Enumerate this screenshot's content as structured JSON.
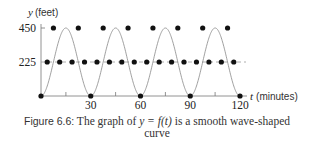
{
  "chart_data": {
    "type": "line",
    "title": "",
    "xlabel_var": "t",
    "xlabel_unit": "(minutes)",
    "ylabel_var": "y",
    "ylabel_unit": "(feet)",
    "x_ticks_labeled": [
      30,
      60,
      90,
      120
    ],
    "x_ticks_minor": [
      15,
      45,
      75,
      105
    ],
    "y_ticks": [
      225,
      450
    ],
    "xlim": [
      0,
      120
    ],
    "ylim": [
      0,
      450
    ],
    "midline": {
      "y": 225,
      "style": "dashed"
    },
    "curve": {
      "description": "smooth wave",
      "period": 30,
      "amplitude": 225,
      "midline": 225,
      "min": 0,
      "max": 450
    },
    "series": [
      {
        "name": "marked points",
        "points": [
          [
            0,
            0
          ],
          [
            3.75,
            225
          ],
          [
            7.5,
            450
          ],
          [
            11.25,
            225
          ],
          [
            15,
            0
          ],
          [
            18.75,
            225
          ],
          [
            22.5,
            450
          ],
          [
            26.25,
            225
          ],
          [
            30,
            0
          ],
          [
            33.75,
            225
          ],
          [
            37.5,
            450
          ],
          [
            41.25,
            225
          ],
          [
            45,
            0
          ],
          [
            48.75,
            225
          ],
          [
            52.5,
            450
          ],
          [
            56.25,
            225
          ],
          [
            60,
            0
          ],
          [
            63.75,
            225
          ],
          [
            67.5,
            450
          ],
          [
            71.25,
            225
          ],
          [
            75,
            0
          ],
          [
            78.75,
            225
          ],
          [
            82.5,
            450
          ],
          [
            86.25,
            225
          ],
          [
            90,
            0
          ],
          [
            93.75,
            225
          ],
          [
            97.5,
            450
          ],
          [
            101.25,
            225
          ],
          [
            105,
            0
          ],
          [
            108.75,
            225
          ],
          [
            112.5,
            450
          ],
          [
            116.25,
            225
          ],
          [
            120,
            0
          ]
        ]
      }
    ],
    "grid": false,
    "legend": null
  },
  "labels": {
    "y_var": "y",
    "y_unit": "(feet)",
    "t_var": "t",
    "t_unit": "(minutes)",
    "y_tick_450": "450",
    "y_tick_225": "225",
    "x_tick_30": "30",
    "x_tick_60": "60",
    "x_tick_90": "90",
    "x_tick_120": "120"
  },
  "caption": {
    "figure_label": "Figure 6.6:",
    "text_before": " The graph of ",
    "math": "y = f(t)",
    "text_after_line1": " is a smooth wave-shaped",
    "line2": "curve"
  }
}
